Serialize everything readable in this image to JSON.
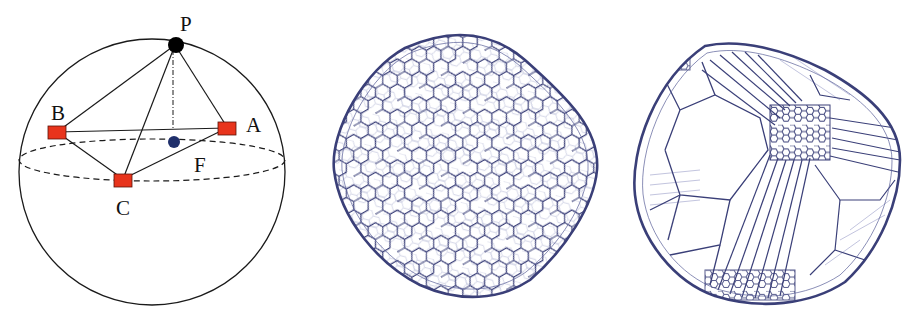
{
  "figure": {
    "panels": [
      {
        "id": "left",
        "kind": "geometric-diagram",
        "description": "Sphere with tetrahedron P-A-B-C; P on top of sphere, A, B, C on equator-ish circle, F projected center point",
        "labels": {
          "P": "P",
          "A": "A",
          "B": "B",
          "C": "C",
          "F": "F"
        },
        "colors": {
          "square_marker": "#e8341c",
          "top_point": "#000000",
          "center_point": "#1f2f6b",
          "lines": "#1a1a1a"
        }
      },
      {
        "id": "middle",
        "kind": "mesh-render",
        "description": "Rounded-cube-like body with uniform hexagonal (Voronoi) wireframe mesh",
        "colors": {
          "mesh_line": "#3a3f78"
        }
      },
      {
        "id": "right",
        "kind": "mesh-render",
        "description": "Rounded-cube-like body with non-uniform Voronoi wireframe mesh, dense hexagons near a pole with radiating elongated cells",
        "colors": {
          "mesh_line": "#3a3f78"
        }
      }
    ]
  }
}
